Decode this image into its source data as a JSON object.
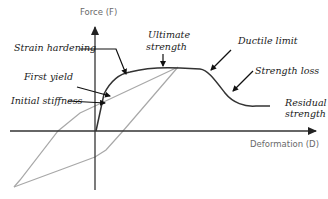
{
  "axes": {
    "y_label": "Force (F)",
    "x_label": "Deformation (D)"
  },
  "annotations": {
    "strain_hardening": "Strain hardening",
    "first_yield": "First yield",
    "initial_stiffness": "Initial stiffness",
    "ultimate_line1": "Ultimate",
    "ultimate_line2": "strength",
    "ductile_limit": "Ductile limit",
    "strength_loss": "Strength loss",
    "residual_line1": "Residual",
    "residual_line2": "strength"
  },
  "colors": {
    "backbone": "#333333",
    "hysteresis": "#a8a8a8",
    "axis": "#333333",
    "axis_label": "#6a6a6a"
  }
}
